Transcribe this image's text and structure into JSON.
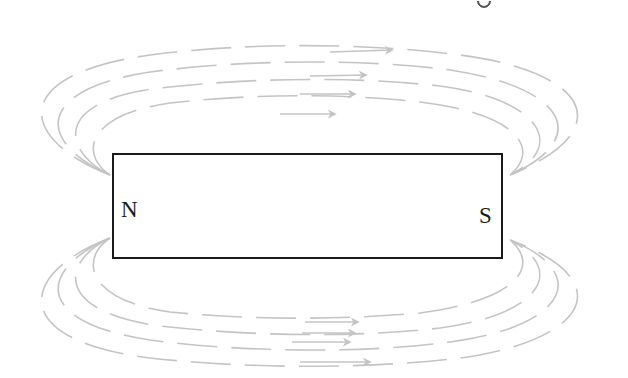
{
  "diagram": {
    "magnet": {
      "north_label": "N",
      "south_label": "S",
      "border_color": "#1a1a1a"
    },
    "field_lines": {
      "color": "#c4c4c4",
      "style": "dashed",
      "direction": "left-to-right (arrows pointing right)",
      "upper_count": 4,
      "lower_count": 4
    }
  }
}
